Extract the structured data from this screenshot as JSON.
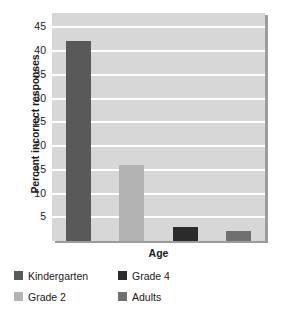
{
  "chart_data": {
    "type": "bar",
    "title": "",
    "xlabel": "Age",
    "ylabel": "Percent incorrect responses",
    "categories": [
      "Kindergarten",
      "Grade 2",
      "Grade 4",
      "Adults"
    ],
    "values": [
      42,
      16,
      3,
      2
    ],
    "series": [
      {
        "name": "Percent incorrect responses",
        "values": [
          42,
          16,
          3,
          2
        ]
      }
    ],
    "ylim": [
      0,
      48
    ],
    "yticks": [
      5,
      10,
      15,
      20,
      25,
      30,
      35,
      40,
      45
    ],
    "ytick_labels": [
      "5",
      "10",
      "15",
      "20",
      "25",
      "30",
      "35",
      "40",
      "45"
    ],
    "xtick_labels": [],
    "grid": "horizontal",
    "legend_position": "below",
    "bar_colors": [
      "#595959",
      "#b3b3b3",
      "#2b2b2b",
      "#707070"
    ],
    "plot_background": "#d7d7d7",
    "gridline_color": "#ffffff",
    "shadow_color": "#9c9c9c",
    "page_background": "#ffffff",
    "text_color": "#1a1a1a"
  },
  "legend": {
    "entries": [
      {
        "label": "Kindergarten",
        "color": "#595959"
      },
      {
        "label": "Grade 4",
        "color": "#2b2b2b"
      },
      {
        "label": "Grade 2",
        "color": "#b3b3b3"
      },
      {
        "label": "Adults",
        "color": "#707070"
      }
    ]
  }
}
